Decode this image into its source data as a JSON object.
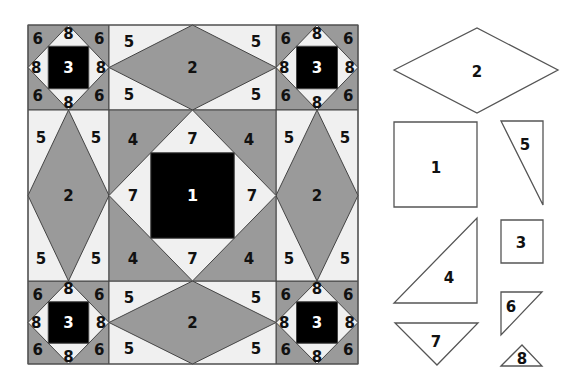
{
  "colors": {
    "light": "#f0f0f0",
    "gray": "#9a9a9a",
    "black": "#000000",
    "stroke": "#444444",
    "template_stroke": "#555555",
    "template_fill": "#ffffff"
  },
  "quilt_block": {
    "bounds": {
      "x": 28,
      "y": 25,
      "w": 330,
      "h": 339
    },
    "cols": [
      28,
      109,
      276,
      358
    ],
    "rows": [
      25,
      110,
      281,
      364
    ],
    "corner_units": [
      {
        "id": "top-left",
        "pos": [
          0,
          0
        ],
        "labels": {
          "center": "3",
          "corners": "6",
          "sides": "8"
        }
      },
      {
        "id": "top-right",
        "pos": [
          2,
          0
        ],
        "labels": {
          "center": "3",
          "corners": "6",
          "sides": "8"
        }
      },
      {
        "id": "bottom-left",
        "pos": [
          0,
          2
        ],
        "labels": {
          "center": "3",
          "corners": "6",
          "sides": "8"
        }
      },
      {
        "id": "bottom-right",
        "pos": [
          2,
          2
        ],
        "labels": {
          "center": "3",
          "corners": "6",
          "sides": "8"
        }
      }
    ],
    "side_units": [
      {
        "id": "top",
        "pos": [
          1,
          0
        ],
        "orientation": "horizontal",
        "labels": {
          "diamond": "2",
          "corners": "5"
        }
      },
      {
        "id": "bottom",
        "pos": [
          1,
          2
        ],
        "orientation": "horizontal",
        "labels": {
          "diamond": "2",
          "corners": "5"
        }
      },
      {
        "id": "left",
        "pos": [
          0,
          1
        ],
        "orientation": "vertical",
        "labels": {
          "diamond": "2",
          "corners": "5"
        }
      },
      {
        "id": "right",
        "pos": [
          2,
          1
        ],
        "orientation": "vertical",
        "labels": {
          "diamond": "2",
          "corners": "5"
        }
      }
    ],
    "center_unit": {
      "pos": [
        1,
        1
      ],
      "labels": {
        "square": "1",
        "sides": "7",
        "corners": "4"
      }
    }
  },
  "template_pieces": [
    {
      "id": "piece-2",
      "label": "2",
      "shape": "diamond",
      "points": [
        [
          394,
          70
        ],
        [
          477,
          28
        ],
        [
          558,
          70
        ],
        [
          477,
          113
        ]
      ],
      "label_pos": [
        477,
        72
      ]
    },
    {
      "id": "piece-1",
      "label": "1",
      "shape": "square",
      "points": [
        [
          394,
          122
        ],
        [
          477,
          122
        ],
        [
          477,
          207
        ],
        [
          394,
          207
        ]
      ],
      "label_pos": [
        436,
        168
      ]
    },
    {
      "id": "piece-5",
      "label": "5",
      "shape": "triangle",
      "points": [
        [
          501,
          121
        ],
        [
          543,
          121
        ],
        [
          543,
          205
        ]
      ],
      "label_pos": [
        525,
        145
      ]
    },
    {
      "id": "piece-4",
      "label": "4",
      "shape": "triangle",
      "points": [
        [
          477,
          218
        ],
        [
          477,
          303
        ],
        [
          394,
          303
        ]
      ],
      "label_pos": [
        449,
        278
      ]
    },
    {
      "id": "piece-3",
      "label": "3",
      "shape": "square",
      "points": [
        [
          501,
          220
        ],
        [
          543,
          220
        ],
        [
          543,
          263
        ],
        [
          501,
          263
        ]
      ],
      "label_pos": [
        521,
        243
      ]
    },
    {
      "id": "piece-7",
      "label": "7",
      "shape": "triangle",
      "points": [
        [
          395,
          323
        ],
        [
          478,
          323
        ],
        [
          437,
          365
        ]
      ],
      "label_pos": [
        436,
        342
      ]
    },
    {
      "id": "piece-6",
      "label": "6",
      "shape": "triangle",
      "points": [
        [
          501,
          292
        ],
        [
          542,
          292
        ],
        [
          501,
          335
        ]
      ],
      "label_pos": [
        511,
        307
      ]
    },
    {
      "id": "piece-8",
      "label": "8",
      "shape": "triangle",
      "points": [
        [
          501,
          366
        ],
        [
          522,
          345
        ],
        [
          542,
          366
        ]
      ],
      "label_pos": [
        522,
        359
      ]
    }
  ]
}
